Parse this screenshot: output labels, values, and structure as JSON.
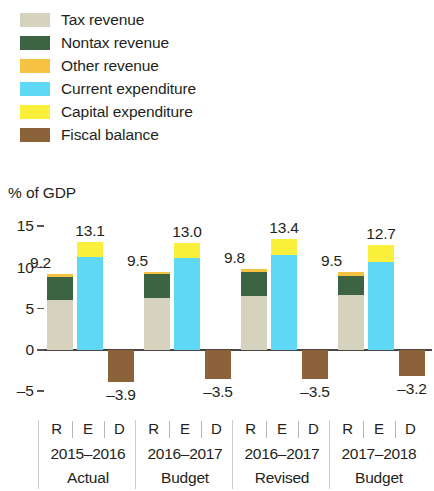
{
  "legend": {
    "items": [
      {
        "label": "Tax revenue",
        "color": "#d5d2bd",
        "key": "tax_revenue"
      },
      {
        "label": "Nontax revenue",
        "color": "#3c6342",
        "key": "nontax_revenue"
      },
      {
        "label": "Other revenue",
        "color": "#f5c341",
        "key": "other_revenue"
      },
      {
        "label": "Current expenditure",
        "color": "#5fd8f5",
        "key": "current_expenditure"
      },
      {
        "label": "Capital expenditure",
        "color": "#faf03c",
        "key": "capital_expenditure"
      },
      {
        "label": "Fiscal balance",
        "color": "#8b6239",
        "key": "fiscal_balance"
      }
    ]
  },
  "axis_title": "% of GDP",
  "chart_data": {
    "type": "bar",
    "title": "",
    "subtitle": "",
    "xlabel": "",
    "ylabel": "% of GDP",
    "ylim": [
      -7,
      16
    ],
    "yticks": [
      15,
      10,
      5,
      0,
      -5
    ],
    "ytick_labels": [
      "15",
      "10",
      "5",
      "0",
      "–5"
    ],
    "grid": false,
    "legend_position": "top-left",
    "stacked": true,
    "bar_kinds": [
      "R",
      "E",
      "D"
    ],
    "bar_kind_meaning": {
      "R": "Revenue",
      "E": "Expenditure",
      "D": "Deficit / fiscal balance"
    },
    "categories": [
      "2015–2016 Actual",
      "2016–2017 Budget",
      "2016–2017 Revised",
      "2017–2018 Budget"
    ],
    "groups": [
      {
        "year": "2015–2016",
        "status": "Actual",
        "revenue": {
          "total": 9.2,
          "total_label": "9.2",
          "segments": [
            {
              "name": "Tax revenue",
              "value": 6.0,
              "color": "#d5d2bd"
            },
            {
              "name": "Nontax revenue",
              "value": 2.9,
              "color": "#3c6342"
            },
            {
              "name": "Other revenue",
              "value": 0.3,
              "color": "#f5c341"
            }
          ]
        },
        "expenditure": {
          "total": 13.1,
          "total_label": "13.1",
          "segments": [
            {
              "name": "Current expenditure",
              "value": 11.3,
              "color": "#5fd8f5"
            },
            {
              "name": "Capital expenditure",
              "value": 1.8,
              "color": "#faf03c"
            }
          ]
        },
        "balance": {
          "value": -3.9,
          "label": "–3.9",
          "color": "#8b6239"
        }
      },
      {
        "year": "2016–2017",
        "status": "Budget",
        "revenue": {
          "total": 9.5,
          "total_label": "9.5",
          "segments": [
            {
              "name": "Tax revenue",
              "value": 6.3,
              "color": "#d5d2bd"
            },
            {
              "name": "Nontax revenue",
              "value": 2.9,
              "color": "#3c6342"
            },
            {
              "name": "Other revenue",
              "value": 0.3,
              "color": "#f5c341"
            }
          ]
        },
        "expenditure": {
          "total": 13.0,
          "total_label": "13.0",
          "segments": [
            {
              "name": "Current expenditure",
              "value": 11.2,
              "color": "#5fd8f5"
            },
            {
              "name": "Capital expenditure",
              "value": 1.8,
              "color": "#faf03c"
            }
          ]
        },
        "balance": {
          "value": -3.5,
          "label": "–3.5",
          "color": "#8b6239"
        }
      },
      {
        "year": "2016–2017",
        "status": "Revised",
        "revenue": {
          "total": 9.8,
          "total_label": "9.8",
          "segments": [
            {
              "name": "Tax revenue",
              "value": 6.6,
              "color": "#d5d2bd"
            },
            {
              "name": "Nontax revenue",
              "value": 2.9,
              "color": "#3c6342"
            },
            {
              "name": "Other revenue",
              "value": 0.3,
              "color": "#f5c341"
            }
          ]
        },
        "expenditure": {
          "total": 13.4,
          "total_label": "13.4",
          "segments": [
            {
              "name": "Current expenditure",
              "value": 11.5,
              "color": "#5fd8f5"
            },
            {
              "name": "Capital expenditure",
              "value": 1.9,
              "color": "#faf03c"
            }
          ]
        },
        "balance": {
          "value": -3.5,
          "label": "–3.5",
          "color": "#8b6239"
        }
      },
      {
        "year": "2017–2018",
        "status": "Budget",
        "revenue": {
          "total": 9.5,
          "total_label": "9.5",
          "segments": [
            {
              "name": "Tax revenue",
              "value": 6.7,
              "color": "#d5d2bd"
            },
            {
              "name": "Nontax revenue",
              "value": 2.3,
              "color": "#3c6342"
            },
            {
              "name": "Other revenue",
              "value": 0.5,
              "color": "#f5c341"
            }
          ]
        },
        "expenditure": {
          "total": 12.7,
          "total_label": "12.7",
          "segments": [
            {
              "name": "Current expenditure",
              "value": 10.7,
              "color": "#5fd8f5"
            },
            {
              "name": "Capital expenditure",
              "value": 2.0,
              "color": "#faf03c"
            }
          ]
        },
        "balance": {
          "value": -3.2,
          "label": "–3.2",
          "color": "#8b6239"
        }
      }
    ]
  }
}
